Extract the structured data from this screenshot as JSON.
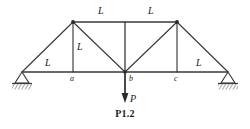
{
  "figure": {
    "caption": "P1.2",
    "background_color": "#ffffff",
    "line_color": "#3a3a3a",
    "text_color": "#1a1a1a"
  },
  "dimension_labels": {
    "bottom_left": "L",
    "bottom_right": "L",
    "top_left": "L",
    "top_right": "L",
    "vertical": "L"
  },
  "node_labels": {
    "a": "a",
    "b": "b",
    "c": "c"
  },
  "load": {
    "label": "P",
    "direction": "down"
  },
  "supports": {
    "left": "pin-support",
    "right": "pin-support"
  },
  "geometry": {
    "bottom_chord": {
      "x1": 22,
      "y1": 72,
      "x2": 228,
      "y2": 72
    },
    "top_chord": {
      "x1": 73,
      "y1": 22,
      "x2": 177,
      "y2": 22
    },
    "nodes": {
      "left_support": {
        "x": 22,
        "y": 72
      },
      "a": {
        "x": 73,
        "y": 72
      },
      "b": {
        "x": 125,
        "y": 72
      },
      "c": {
        "x": 177,
        "y": 72
      },
      "right_support": {
        "x": 228,
        "y": 72
      },
      "top_left": {
        "x": 73,
        "y": 22
      },
      "top_mid": {
        "x": 125,
        "y": 22
      },
      "top_right": {
        "x": 177,
        "y": 22
      }
    }
  }
}
